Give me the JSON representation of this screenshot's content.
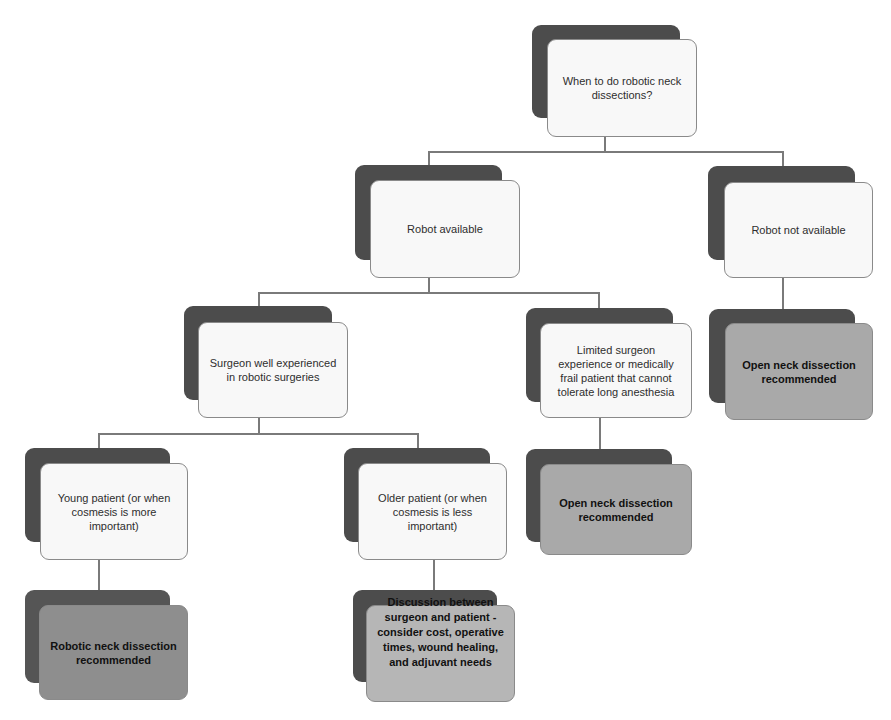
{
  "diagram": {
    "type": "decision-tree",
    "nodes": {
      "root": {
        "label": "When to do robotic neck dissections?"
      },
      "robot_available": {
        "label": "Robot available"
      },
      "robot_not_available": {
        "label": "Robot not available"
      },
      "surgeon_experienced": {
        "label": "Surgeon well experienced in robotic surgeries"
      },
      "limited_experience": {
        "label": "Limited surgeon experience or medically frail patient that cannot tolerate long anesthesia"
      },
      "open_neck_right": {
        "label": "Open neck dissection recommended"
      },
      "open_neck_middle": {
        "label": "Open neck dissection recommended"
      },
      "young_patient": {
        "label": "Young patient (or when cosmesis is more important)"
      },
      "older_patient": {
        "label": "Older patient (or when cosmesis is less important)"
      },
      "robotic_neck": {
        "label": "Robotic neck dissection recommended"
      },
      "discussion": {
        "label": "Discussion between surgeon and patient - consider cost, operative times, wound healing, and adjuvant needs"
      }
    },
    "edges": [
      [
        "root",
        "robot_available"
      ],
      [
        "root",
        "robot_not_available"
      ],
      [
        "robot_available",
        "surgeon_experienced"
      ],
      [
        "robot_available",
        "limited_experience"
      ],
      [
        "robot_not_available",
        "open_neck_right"
      ],
      [
        "limited_experience",
        "open_neck_middle"
      ],
      [
        "surgeon_experienced",
        "young_patient"
      ],
      [
        "surgeon_experienced",
        "older_patient"
      ],
      [
        "young_patient",
        "robotic_neck"
      ],
      [
        "older_patient",
        "discussion"
      ]
    ],
    "colors": {
      "shadow": "#4c4c4c",
      "decision_fill": "#f8f8f8",
      "outcome_fill": "#a9a9a9",
      "connector": "#7a7a7a"
    }
  }
}
